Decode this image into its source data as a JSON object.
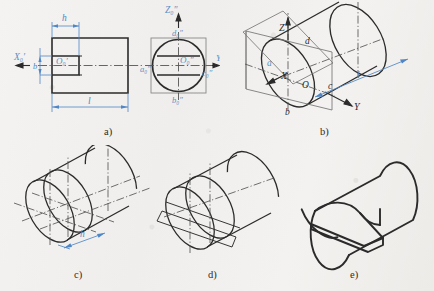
{
  "figure": {
    "title": "",
    "background_color": "#f2f1ef",
    "line_color": "#2b2b2b",
    "dim_color": "#4f86c6",
    "label_color": "#5a8fc4"
  },
  "subfigures": [
    {
      "id": "a",
      "caption": "a)"
    },
    {
      "id": "b",
      "caption": "b)"
    },
    {
      "id": "c",
      "caption": "c)"
    },
    {
      "id": "d",
      "caption": "d)"
    },
    {
      "id": "e",
      "caption": "e)"
    }
  ],
  "part_a": {
    "caption": "a)",
    "front_view": {
      "dim_h": "h",
      "dim_l": "l",
      "dim_b": "b",
      "axis_x": "X₀′",
      "origin": "O₀′"
    },
    "side_view": {
      "axis_z": "Z₀″",
      "axis_y": "Y",
      "origin": "O₀″",
      "pt_a": "a₀″",
      "pt_b": "b₀″",
      "pt_c": "c₀″",
      "pt_d": "d₀″"
    }
  },
  "part_b": {
    "caption": "b)",
    "axis_z": "Z",
    "axis_x": "X",
    "axis_y": "Y",
    "origin": "O",
    "pt_a": "a",
    "pt_b": "b",
    "pt_c": "c",
    "pt_d": "d",
    "dim_l": "l"
  },
  "part_c": {
    "caption": "c)",
    "dim_h": "h"
  },
  "part_d": {
    "caption": "d)"
  },
  "part_e": {
    "caption": "e)"
  }
}
